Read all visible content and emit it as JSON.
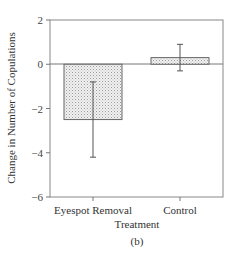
{
  "chart_data": {
    "type": "bar",
    "title": "",
    "xlabel": "Treatment",
    "ylabel": "Change in Number of Copulations",
    "panel_label": "(b)",
    "categories": [
      "Eyespot Removal",
      "Control"
    ],
    "values": [
      -2.5,
      0.3
    ],
    "error_bars": [
      {
        "low": -4.2,
        "high": -0.8
      },
      {
        "low": -0.3,
        "high": 0.9
      }
    ],
    "ylim": [
      -6,
      2
    ],
    "yticks": [
      2,
      0,
      -2,
      -4,
      -6
    ],
    "ytick_labels": [
      "2",
      "0",
      "−2",
      "−4",
      "−6"
    ],
    "grid": false,
    "legend": null,
    "bar_fill": "stippled light gray",
    "colors": {
      "axis": "#777777",
      "bar_edge": "#666666",
      "bar_fill": "#e8e8e8",
      "dots": "#9a9a9a",
      "error": "#555555"
    }
  }
}
